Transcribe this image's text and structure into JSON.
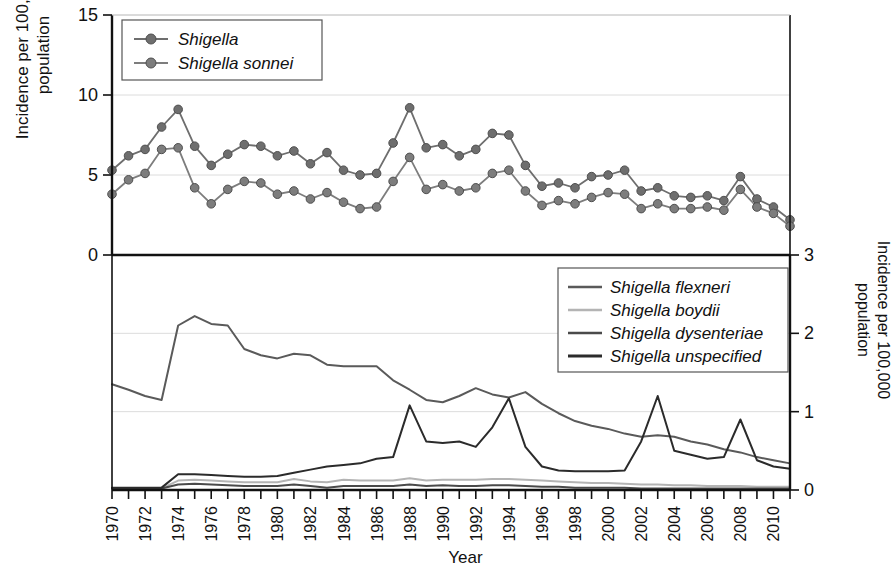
{
  "figure": {
    "xlabel": "Year",
    "ylabel_left_line1": "Incidence per 100,000",
    "ylabel_left_line2": "population",
    "ylabel_right_line1": "Incidence per 100,000",
    "ylabel_right_line2": "population"
  },
  "legend_top": {
    "items": [
      {
        "label": "Shigella",
        "color": "#6e6e6e",
        "marker": "circle"
      },
      {
        "label": "Shigella sonnei",
        "color": "#7d7d7d",
        "marker": "circle"
      }
    ]
  },
  "legend_bottom": {
    "items": [
      {
        "label": "Shigella flexneri",
        "color": "#5a5a5a"
      },
      {
        "label": "Shigella boydii",
        "color": "#b4b4b4"
      },
      {
        "label": "Shigella dysenteriae",
        "color": "#4a4a4a"
      },
      {
        "label": "Shigella unspecified",
        "color": "#2b2b2b"
      }
    ]
  },
  "chart_data": [
    {
      "type": "line",
      "panel": "top",
      "title": "",
      "xlabel": "Year",
      "ylabel": "Incidence per 100,000 population",
      "ylim": [
        0,
        15
      ],
      "yticks": [
        0,
        5,
        10,
        15
      ],
      "xlim": [
        1970,
        2011
      ],
      "grid": true,
      "legend_position": "top-left",
      "x": [
        1970,
        1971,
        1972,
        1973,
        1974,
        1975,
        1976,
        1977,
        1978,
        1979,
        1980,
        1981,
        1982,
        1983,
        1984,
        1985,
        1986,
        1987,
        1988,
        1989,
        1990,
        1991,
        1992,
        1993,
        1994,
        1995,
        1996,
        1997,
        1998,
        1999,
        2000,
        2001,
        2002,
        2003,
        2004,
        2005,
        2006,
        2007,
        2008,
        2009,
        2010,
        2011
      ],
      "series": [
        {
          "name": "Shigella",
          "color": "#6e6e6e",
          "marker": "circle",
          "values": [
            5.3,
            6.2,
            6.6,
            8.0,
            9.1,
            6.8,
            5.6,
            6.3,
            6.9,
            6.8,
            6.2,
            6.5,
            5.7,
            6.4,
            5.3,
            5.0,
            5.1,
            7.0,
            9.2,
            6.7,
            6.9,
            6.2,
            6.6,
            7.6,
            7.5,
            5.6,
            4.3,
            4.5,
            4.2,
            4.9,
            5.0,
            5.3,
            4.0,
            4.2,
            3.7,
            3.6,
            3.7,
            3.4,
            4.9,
            3.5,
            3.0,
            2.2
          ]
        },
        {
          "name": "Shigella sonnei",
          "color": "#7d7d7d",
          "marker": "circle",
          "values": [
            3.8,
            4.7,
            5.1,
            6.6,
            6.7,
            4.2,
            3.2,
            4.1,
            4.6,
            4.5,
            3.8,
            4.0,
            3.5,
            3.9,
            3.3,
            2.9,
            3.0,
            4.6,
            6.1,
            4.1,
            4.4,
            4.0,
            4.2,
            5.1,
            5.3,
            4.0,
            3.1,
            3.4,
            3.2,
            3.6,
            3.9,
            3.8,
            2.9,
            3.2,
            2.9,
            2.9,
            3.0,
            2.8,
            4.1,
            3.0,
            2.6,
            1.8
          ]
        }
      ]
    },
    {
      "type": "line",
      "panel": "bottom",
      "title": "",
      "xlabel": "Year",
      "ylabel": "Incidence per 100,000 population",
      "ylim": [
        0,
        3
      ],
      "yticks": [
        0,
        1,
        2,
        3
      ],
      "xlim": [
        1970,
        2011
      ],
      "grid": true,
      "legend_position": "top-right",
      "x": [
        1970,
        1971,
        1972,
        1973,
        1974,
        1975,
        1976,
        1977,
        1978,
        1979,
        1980,
        1981,
        1982,
        1983,
        1984,
        1985,
        1986,
        1987,
        1988,
        1989,
        1990,
        1991,
        1992,
        1993,
        1994,
        1995,
        1996,
        1997,
        1998,
        1999,
        2000,
        2001,
        2002,
        2003,
        2004,
        2005,
        2006,
        2007,
        2008,
        2009,
        2010,
        2011
      ],
      "series": [
        {
          "name": "Shigella flexneri",
          "color": "#5a5a5a",
          "values": [
            1.35,
            1.28,
            1.2,
            1.15,
            2.1,
            2.22,
            2.12,
            2.1,
            1.8,
            1.72,
            1.68,
            1.74,
            1.72,
            1.6,
            1.58,
            1.58,
            1.58,
            1.4,
            1.28,
            1.15,
            1.12,
            1.2,
            1.3,
            1.22,
            1.18,
            1.25,
            1.1,
            0.98,
            0.88,
            0.82,
            0.78,
            0.72,
            0.68,
            0.7,
            0.68,
            0.62,
            0.58,
            0.52,
            0.48,
            0.42,
            0.38,
            0.34
          ]
        },
        {
          "name": "Shigella boydii",
          "color": "#b4b4b4",
          "values": [
            0.02,
            0.02,
            0.02,
            0.02,
            0.12,
            0.13,
            0.12,
            0.11,
            0.1,
            0.1,
            0.1,
            0.14,
            0.11,
            0.1,
            0.13,
            0.12,
            0.12,
            0.12,
            0.15,
            0.12,
            0.13,
            0.13,
            0.13,
            0.14,
            0.14,
            0.13,
            0.12,
            0.11,
            0.1,
            0.09,
            0.09,
            0.08,
            0.07,
            0.07,
            0.06,
            0.06,
            0.05,
            0.05,
            0.05,
            0.04,
            0.04,
            0.04
          ]
        },
        {
          "name": "Shigella dysenteriae",
          "color": "#4a4a4a",
          "values": [
            0.02,
            0.02,
            0.02,
            0.02,
            0.07,
            0.08,
            0.07,
            0.06,
            0.05,
            0.05,
            0.05,
            0.07,
            0.05,
            0.03,
            0.05,
            0.05,
            0.05,
            0.05,
            0.07,
            0.05,
            0.06,
            0.05,
            0.05,
            0.06,
            0.06,
            0.05,
            0.04,
            0.04,
            0.03,
            0.03,
            0.03,
            0.03,
            0.02,
            0.02,
            0.02,
            0.02,
            0.02,
            0.02,
            0.02,
            0.02,
            0.02,
            0.02
          ]
        },
        {
          "name": "Shigella unspecified",
          "color": "#2b2b2b",
          "values": [
            0.03,
            0.03,
            0.03,
            0.03,
            0.2,
            0.2,
            0.19,
            0.18,
            0.17,
            0.17,
            0.18,
            0.22,
            0.26,
            0.3,
            0.32,
            0.34,
            0.4,
            0.42,
            1.08,
            0.62,
            0.6,
            0.62,
            0.55,
            0.8,
            1.17,
            0.55,
            0.3,
            0.25,
            0.24,
            0.24,
            0.24,
            0.25,
            0.62,
            1.2,
            0.5,
            0.45,
            0.4,
            0.42,
            0.9,
            0.38,
            0.3,
            0.27
          ]
        }
      ]
    }
  ]
}
